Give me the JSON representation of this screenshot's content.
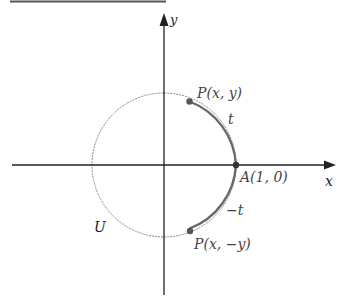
{
  "diagram": {
    "axes": {
      "x_label": "x",
      "y_label": "y"
    },
    "circle_label": "U",
    "points": {
      "P_top": "P(x, y)",
      "A": "A(1, 0)",
      "P_bottom": "P(x, −y)"
    },
    "arcs": {
      "upper": "t",
      "lower": "−t"
    },
    "colors": {
      "axis": "#222222",
      "circle": "#777777",
      "arc": "#6a6a6a",
      "point": "#555555",
      "label": "#444444"
    }
  }
}
